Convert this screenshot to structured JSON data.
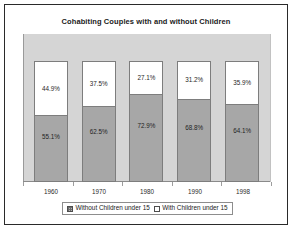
{
  "chart_data": {
    "type": "bar",
    "subtype": "stacked-100-percent",
    "title": "Cohabiting Couples with and without Children",
    "xlabel": "",
    "ylabel": "",
    "ylim": [
      0,
      100
    ],
    "grid": false,
    "legend_position": "bottom",
    "categories": [
      "1960",
      "1970",
      "1980",
      "1990",
      "1998"
    ],
    "series": [
      {
        "name": "Without Children under 15",
        "color": "#a7a7a7",
        "swatch": "hatch-square-icon",
        "values": [
          55.1,
          62.5,
          72.9,
          68.8,
          64.1
        ],
        "labels": [
          "55.1%",
          "62.5%",
          "72.9%",
          "68.8%",
          "64.1%"
        ]
      },
      {
        "name": "With Children under 15",
        "color": "#ffffff",
        "swatch": "empty-square-icon",
        "values": [
          44.9,
          37.5,
          27.1,
          31.2,
          35.9
        ],
        "labels": [
          "44.9%",
          "37.5%",
          "27.1%",
          "31.2%",
          "35.9%"
        ]
      }
    ],
    "plot_background": "#d5d5d5",
    "frame_color": "#2a2a2a"
  },
  "legend": {
    "entries": [
      {
        "label": "Without Children under 15"
      },
      {
        "label": "With Children under 15"
      }
    ]
  }
}
